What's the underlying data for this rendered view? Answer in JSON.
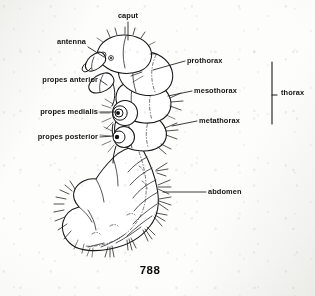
{
  "figure": {
    "number": "788",
    "background_color": "#fdfdfc",
    "ink_color": "#161616"
  },
  "labels": [
    {
      "id": "caput",
      "text": "caput",
      "side": "top",
      "x": 128,
      "y": 18
    },
    {
      "id": "antenna",
      "text": "antenna",
      "side": "left",
      "x": 86,
      "y": 44
    },
    {
      "id": "propes-anterior",
      "text": "propes anterior",
      "side": "left",
      "x": 98,
      "y": 82
    },
    {
      "id": "propes-medialis",
      "text": "propes medialis",
      "side": "left",
      "x": 98,
      "y": 114
    },
    {
      "id": "propes-posterior",
      "text": "propes posterior",
      "side": "left",
      "x": 98,
      "y": 139
    },
    {
      "id": "prothorax",
      "text": "prothorax",
      "side": "right",
      "x": 187,
      "y": 63
    },
    {
      "id": "mesothorax",
      "text": "mesothorax",
      "side": "right",
      "x": 194,
      "y": 93
    },
    {
      "id": "metathorax",
      "text": "metathorax",
      "side": "right",
      "x": 199,
      "y": 123
    },
    {
      "id": "abdomen",
      "text": "abdomen",
      "side": "right",
      "x": 208,
      "y": 194
    },
    {
      "id": "thorax",
      "text": "thorax",
      "side": "right",
      "x": 281,
      "y": 95
    }
  ],
  "bracket": {
    "id": "thorax-bracket",
    "x": 272,
    "y_top": 62,
    "y_bottom": 124,
    "tick_x": 276,
    "tick_y": 95
  },
  "diagram": {
    "body_parts": [
      "caput",
      "prothorax",
      "mesothorax",
      "metathorax",
      "propes anterior",
      "propes medialis",
      "propes posterior",
      "abdomen"
    ],
    "abdominal_segment_count": 9,
    "proleg_count": 3
  }
}
